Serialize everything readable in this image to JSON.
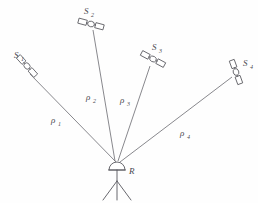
{
  "figure": {
    "background_color": "#fefefe",
    "line_color": "#6a6a70",
    "stroke_color": "#57575d",
    "text_color": "#4a4a50"
  },
  "receiver": {
    "label": "R",
    "name": "ground receiver antenna on tripod",
    "x": 117,
    "y": 163
  },
  "satellites": [
    {
      "id": "S1",
      "label": "S",
      "subscript": "1",
      "label_x": 14,
      "label_y": 58,
      "sub_x": 21,
      "sub_y": 61,
      "cx": 27,
      "cy": 66,
      "angle": 48
    },
    {
      "id": "S2",
      "label": "S",
      "subscript": "2",
      "label_x": 84,
      "label_y": 14,
      "sub_x": 91,
      "sub_y": 17,
      "cx": 91,
      "cy": 24,
      "angle": 15
    },
    {
      "id": "S3",
      "label": "S",
      "subscript": "3",
      "label_x": 152,
      "label_y": 50,
      "sub_x": 159,
      "sub_y": 53,
      "cx": 153,
      "cy": 59,
      "angle": 28
    },
    {
      "id": "S4",
      "label": "S",
      "subscript": "4",
      "label_x": 243,
      "label_y": 66,
      "sub_x": 250,
      "sub_y": 69,
      "cx": 236,
      "cy": 72,
      "angle": 70
    }
  ],
  "ranges": [
    {
      "id": "rho1",
      "symbol": "ρ",
      "subscript": "1",
      "from": "S1",
      "to": "R",
      "x1": 30,
      "y1": 74,
      "x2": 116,
      "y2": 162,
      "label_x": 51,
      "label_y": 123,
      "sub_x": 58,
      "sub_y": 126
    },
    {
      "id": "rho2",
      "symbol": "ρ",
      "subscript": "2",
      "from": "S2",
      "to": "R",
      "x1": 93,
      "y1": 30,
      "x2": 115,
      "y2": 161,
      "label_x": 86,
      "label_y": 100,
      "sub_x": 93,
      "sub_y": 103
    },
    {
      "id": "rho3",
      "symbol": "ρ",
      "subscript": "3",
      "from": "S3",
      "to": "R",
      "x1": 150,
      "y1": 66,
      "x2": 118,
      "y2": 161,
      "label_x": 120,
      "label_y": 103,
      "sub_x": 127,
      "sub_y": 106
    },
    {
      "id": "rho4",
      "symbol": "ρ",
      "subscript": "4",
      "from": "S4",
      "to": "R",
      "x1": 232,
      "y1": 77,
      "x2": 120,
      "y2": 162,
      "label_x": 180,
      "label_y": 136,
      "sub_x": 187,
      "sub_y": 139
    }
  ]
}
